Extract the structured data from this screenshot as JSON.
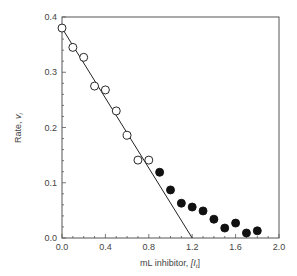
{
  "chart_data": {
    "type": "scatter",
    "title": "",
    "xlabel": "mL inhibitor, [I_t]",
    "xlabel_main": "mL inhibitor, ",
    "xlabel_var": "[I",
    "xlabel_sub": "t",
    "xlabel_end": "]",
    "ylabel": "Rate, v_i",
    "ylabel_main": "Rate, ",
    "ylabel_var": "v",
    "ylabel_sub": "i",
    "xlim": [
      0.0,
      2.0
    ],
    "ylim": [
      0.0,
      0.4
    ],
    "xticks": [
      "0.0",
      "0.4",
      "0.8",
      "1.2",
      "1.6",
      "2.0"
    ],
    "yticks": [
      "0.0",
      "0.1",
      "0.2",
      "0.3",
      "0.4"
    ],
    "grid": false,
    "legend": null,
    "series": [
      {
        "name": "open circles",
        "marker": "open-circle",
        "x": [
          0.0,
          0.1,
          0.2,
          0.3,
          0.4,
          0.5,
          0.6,
          0.7,
          0.8
        ],
        "y": [
          0.38,
          0.345,
          0.327,
          0.275,
          0.268,
          0.23,
          0.186,
          0.141,
          0.141
        ]
      },
      {
        "name": "filled circles",
        "marker": "filled-circle",
        "x": [
          0.9,
          1.0,
          1.1,
          1.2,
          1.3,
          1.4,
          1.5,
          1.6,
          1.7,
          1.8
        ],
        "y": [
          0.119,
          0.087,
          0.063,
          0.056,
          0.049,
          0.034,
          0.018,
          0.027,
          0.009,
          0.013
        ]
      },
      {
        "name": "fitted line",
        "marker": "line",
        "x": [
          0.0,
          1.2
        ],
        "y": [
          0.38,
          0.0
        ]
      }
    ]
  },
  "colors": {
    "axis": "#555555",
    "marker": "#111111",
    "line": "#222222",
    "text": "#444444"
  }
}
